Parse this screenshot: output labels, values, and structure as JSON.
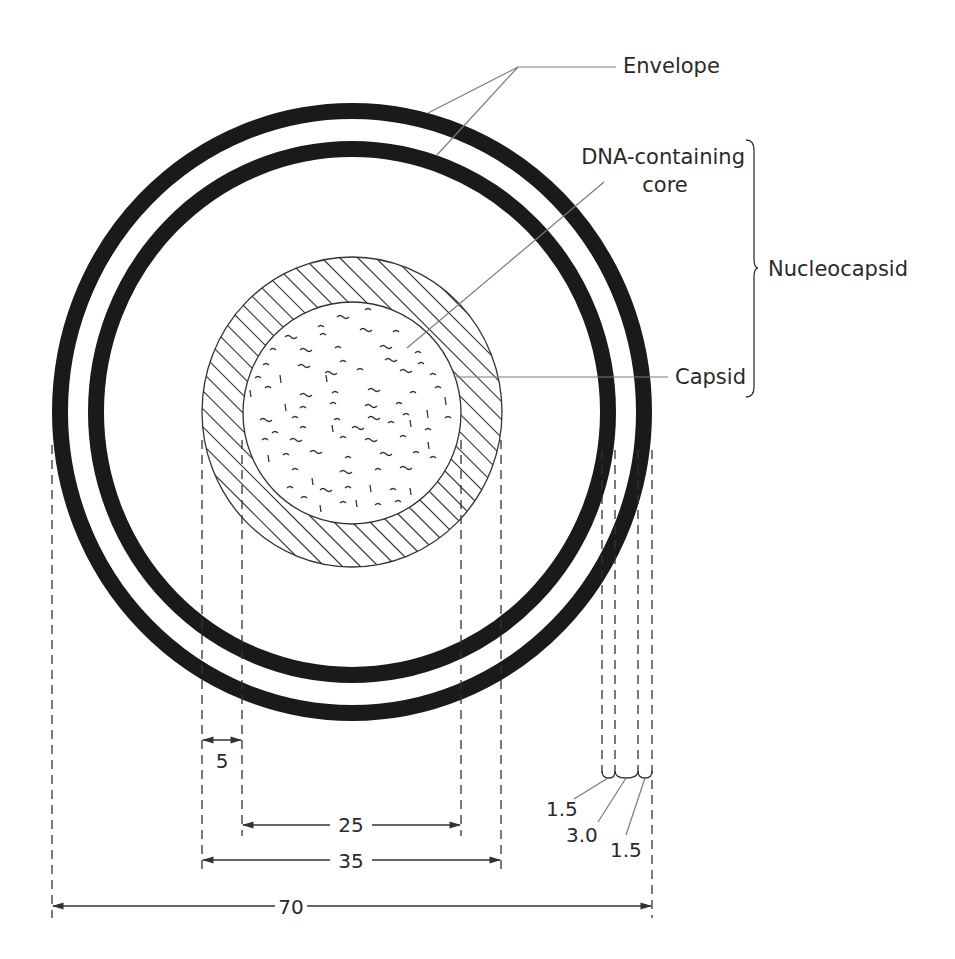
{
  "diagram": {
    "labels": {
      "envelope": "Envelope",
      "core_line1": "DNA-containing",
      "core_line2": "core",
      "nucleocapsid": "Nucleocapsid",
      "capsid": "Capsid"
    },
    "dimensions": {
      "capsid_thickness": "5",
      "core_diameter": "25",
      "capsid_diameter": "35",
      "total_diameter": "70",
      "envelope_outer_layer": "1.5",
      "envelope_gap": "3.0",
      "envelope_inner_layer": "1.5"
    },
    "colors": {
      "ring": "#1a1a1a",
      "line": "#333333",
      "leader": "#7a7a7a",
      "background": "#ffffff"
    }
  }
}
